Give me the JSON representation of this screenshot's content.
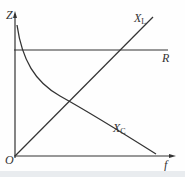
{
  "diagram": {
    "title": "",
    "axes": {
      "y_label": "Z",
      "x_label": "f",
      "origin_label": "O"
    },
    "curves": [
      {
        "name": "R",
        "label_main": "R",
        "label_sub": "",
        "shape": "horizontal line"
      },
      {
        "name": "X_L",
        "label_main": "X",
        "label_sub": "L",
        "shape": "straight line through origin"
      },
      {
        "name": "X_C",
        "label_main": "X",
        "label_sub": "C",
        "shape": "decreasing hyperbolic curve"
      }
    ],
    "colors": {
      "line": "#333333",
      "background": "#fefefe"
    }
  }
}
